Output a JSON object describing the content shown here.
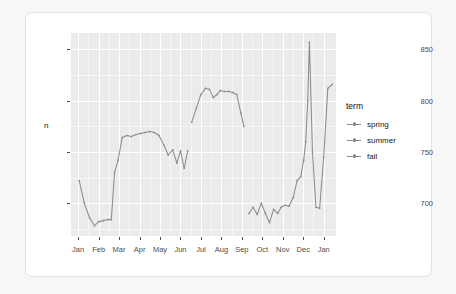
{
  "chart_data": {
    "type": "line",
    "title": "",
    "xlabel": "",
    "ylabel": "n",
    "legend_title": "term",
    "legend_position": "right",
    "grid": true,
    "ylim": [
      668,
      866
    ],
    "yticks": [
      700,
      750,
      800,
      850
    ],
    "ytick_labels": [
      "700",
      "750",
      "800",
      "850"
    ],
    "xticks": [
      0,
      1,
      2,
      3,
      4,
      5,
      6,
      7,
      8,
      9,
      10,
      11,
      12
    ],
    "xtick_labels": [
      "Jan",
      "Feb",
      "Mar",
      "Apr",
      "May",
      "Jun",
      "Jul",
      "Aug",
      "Sep",
      "Oct",
      "Nov",
      "Dec",
      "Jan"
    ],
    "xlim": [
      -0.35,
      12.6
    ],
    "series": [
      {
        "name": "spring",
        "color": "#8c8c8c",
        "x": [
          0.05,
          0.3,
          0.55,
          0.8,
          1.0,
          1.22,
          1.45,
          1.62,
          1.78,
          1.95,
          2.15,
          2.38,
          2.6,
          2.82,
          3.05,
          3.28,
          3.5,
          3.72,
          3.95,
          4.18,
          4.4,
          4.62,
          4.82,
          5.0,
          5.18,
          5.35
        ],
        "y": [
          722,
          700,
          686,
          678,
          682,
          683,
          684,
          684,
          730,
          742,
          764,
          766,
          765,
          767,
          768,
          769,
          770,
          769,
          766,
          757,
          747,
          752,
          739,
          751,
          734,
          751
        ]
      },
      {
        "name": "summer",
        "color": "#8c8c8c",
        "x": [
          5.55,
          5.78,
          6.0,
          6.22,
          6.42,
          6.6,
          6.78,
          6.95,
          7.15,
          7.35,
          7.55,
          7.75,
          7.95,
          8.1
        ],
        "y": [
          779,
          793,
          806,
          812,
          811,
          803,
          806,
          810,
          809,
          809,
          808,
          806,
          788,
          775
        ]
      },
      {
        "name": "fall",
        "color": "#8c8c8c",
        "x": [
          8.35,
          8.55,
          8.75,
          8.95,
          9.15,
          9.35,
          9.55,
          9.75,
          9.92,
          10.1,
          10.3,
          10.5,
          10.7,
          10.88,
          11.02,
          11.12,
          11.22,
          11.3,
          11.45,
          11.62,
          11.8,
          12.0,
          12.2,
          12.42
        ],
        "y": [
          690,
          696,
          689,
          700,
          690,
          681,
          694,
          690,
          696,
          698,
          697,
          705,
          722,
          726,
          742,
          760,
          800,
          857,
          750,
          696,
          695,
          745,
          812,
          816
        ]
      }
    ]
  },
  "panel": {
    "background_color": "#ebebeb",
    "gridline_color": "#ffffff"
  },
  "card": {
    "background_color": "#ffffff",
    "border_color": "#e2e2e2"
  }
}
